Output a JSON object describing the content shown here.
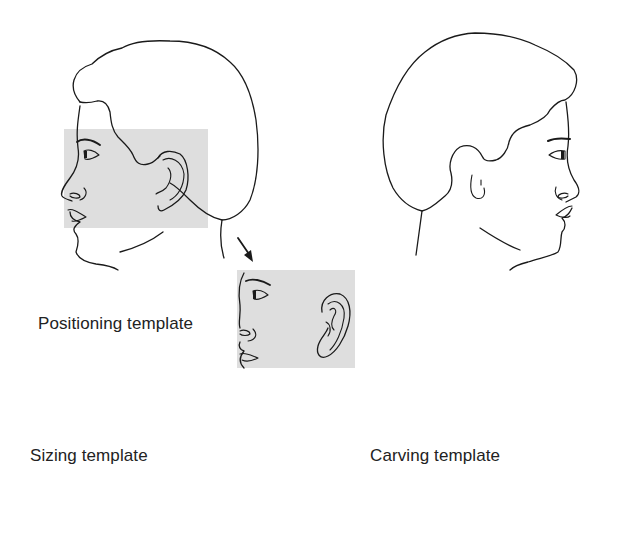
{
  "figure": {
    "colors": {
      "line": "#1a1a1a",
      "template_fill": "#dcdcdc",
      "background": "#ffffff"
    },
    "panels": [
      {
        "id": "left-profile",
        "description": "Left-facing head profile with shaded region over face and normal ear"
      },
      {
        "id": "right-profile",
        "description": "Right-facing head profile showing microtia ear remnant"
      },
      {
        "id": "positioning",
        "description": "Shaded face-and-ear positioning template"
      },
      {
        "id": "sizing",
        "description": "Ear outline sizing template with dashed margin"
      },
      {
        "id": "carving",
        "description": "Cartilage framework carving template"
      }
    ],
    "labels": {
      "positioning": "Positioning template",
      "sizing": "Sizing template",
      "carving": "Carving template"
    },
    "arrows": [
      {
        "from": "left-profile",
        "to": "positioning",
        "style": "straight"
      },
      {
        "from": "positioning",
        "to": "sizing",
        "style": "straight"
      },
      {
        "from": "sizing",
        "to": "carving",
        "style": "looped"
      }
    ]
  }
}
